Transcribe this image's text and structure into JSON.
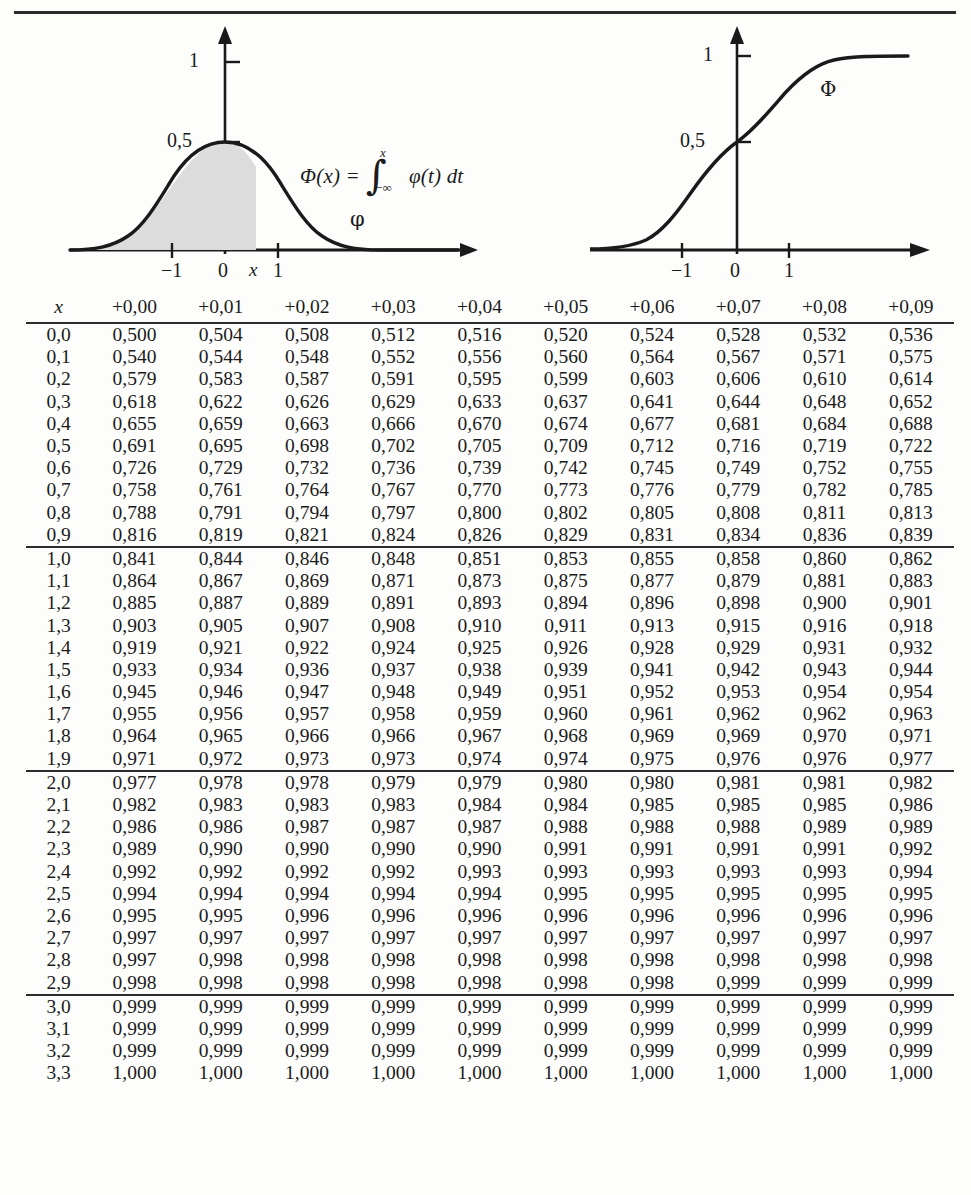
{
  "figures": {
    "density": {
      "name": "standard-normal-density",
      "curve_label": "φ",
      "y_ticks": [
        "1",
        "0,5"
      ],
      "x_ticks": [
        "−1",
        "0",
        "x",
        "1"
      ],
      "shaded_region": "area under φ from -∞ to x"
    },
    "cdf": {
      "name": "standard-normal-cdf",
      "curve_label": "Φ",
      "y_ticks": [
        "1",
        "0,5"
      ],
      "x_ticks": [
        "−1",
        "0",
        "1"
      ]
    },
    "formula": {
      "lhs": "Φ(x) =",
      "integral_upper": "x",
      "integral_lower": "−∞",
      "integrand": "φ(t) dt"
    }
  },
  "table": {
    "columns": [
      "x",
      "+0,00",
      "+0,01",
      "+0,02",
      "+0,03",
      "+0,04",
      "+0,05",
      "+0,06",
      "+0,07",
      "+0,08",
      "+0,09"
    ],
    "blocks": [
      {
        "rows": [
          [
            "0,0",
            "0,500",
            "0,504",
            "0,508",
            "0,512",
            "0,516",
            "0,520",
            "0,524",
            "0,528",
            "0,532",
            "0,536"
          ],
          [
            "0,1",
            "0,540",
            "0,544",
            "0,548",
            "0,552",
            "0,556",
            "0,560",
            "0,564",
            "0,567",
            "0,571",
            "0,575"
          ],
          [
            "0,2",
            "0,579",
            "0,583",
            "0,587",
            "0,591",
            "0,595",
            "0,599",
            "0,603",
            "0,606",
            "0,610",
            "0,614"
          ],
          [
            "0,3",
            "0,618",
            "0,622",
            "0,626",
            "0,629",
            "0,633",
            "0,637",
            "0,641",
            "0,644",
            "0,648",
            "0,652"
          ],
          [
            "0,4",
            "0,655",
            "0,659",
            "0,663",
            "0,666",
            "0,670",
            "0,674",
            "0,677",
            "0,681",
            "0,684",
            "0,688"
          ],
          [
            "0,5",
            "0,691",
            "0,695",
            "0,698",
            "0,702",
            "0,705",
            "0,709",
            "0,712",
            "0,716",
            "0,719",
            "0,722"
          ],
          [
            "0,6",
            "0,726",
            "0,729",
            "0,732",
            "0,736",
            "0,739",
            "0,742",
            "0,745",
            "0,749",
            "0,752",
            "0,755"
          ],
          [
            "0,7",
            "0,758",
            "0,761",
            "0,764",
            "0,767",
            "0,770",
            "0,773",
            "0,776",
            "0,779",
            "0,782",
            "0,785"
          ],
          [
            "0,8",
            "0,788",
            "0,791",
            "0,794",
            "0,797",
            "0,800",
            "0,802",
            "0,805",
            "0,808",
            "0,811",
            "0,813"
          ],
          [
            "0,9",
            "0,816",
            "0,819",
            "0,821",
            "0,824",
            "0,826",
            "0,829",
            "0,831",
            "0,834",
            "0,836",
            "0,839"
          ]
        ]
      },
      {
        "rows": [
          [
            "1,0",
            "0,841",
            "0,844",
            "0,846",
            "0,848",
            "0,851",
            "0,853",
            "0,855",
            "0,858",
            "0,860",
            "0,862"
          ],
          [
            "1,1",
            "0,864",
            "0,867",
            "0,869",
            "0,871",
            "0,873",
            "0,875",
            "0,877",
            "0,879",
            "0,881",
            "0,883"
          ],
          [
            "1,2",
            "0,885",
            "0,887",
            "0,889",
            "0,891",
            "0,893",
            "0,894",
            "0,896",
            "0,898",
            "0,900",
            "0,901"
          ],
          [
            "1,3",
            "0,903",
            "0,905",
            "0,907",
            "0,908",
            "0,910",
            "0,911",
            "0,913",
            "0,915",
            "0,916",
            "0,918"
          ],
          [
            "1,4",
            "0,919",
            "0,921",
            "0,922",
            "0,924",
            "0,925",
            "0,926",
            "0,928",
            "0,929",
            "0,931",
            "0,932"
          ],
          [
            "1,5",
            "0,933",
            "0,934",
            "0,936",
            "0,937",
            "0,938",
            "0,939",
            "0,941",
            "0,942",
            "0,943",
            "0,944"
          ],
          [
            "1,6",
            "0,945",
            "0,946",
            "0,947",
            "0,948",
            "0,949",
            "0,951",
            "0,952",
            "0,953",
            "0,954",
            "0,954"
          ],
          [
            "1,7",
            "0,955",
            "0,956",
            "0,957",
            "0,958",
            "0,959",
            "0,960",
            "0,961",
            "0,962",
            "0,962",
            "0,963"
          ],
          [
            "1,8",
            "0,964",
            "0,965",
            "0,966",
            "0,966",
            "0,967",
            "0,968",
            "0,969",
            "0,969",
            "0,970",
            "0,971"
          ],
          [
            "1,9",
            "0,971",
            "0,972",
            "0,973",
            "0,973",
            "0,974",
            "0,974",
            "0,975",
            "0,976",
            "0,976",
            "0,977"
          ]
        ]
      },
      {
        "rows": [
          [
            "2,0",
            "0,977",
            "0,978",
            "0,978",
            "0,979",
            "0,979",
            "0,980",
            "0,980",
            "0,981",
            "0,981",
            "0,982"
          ],
          [
            "2,1",
            "0,982",
            "0,983",
            "0,983",
            "0,983",
            "0,984",
            "0,984",
            "0,985",
            "0,985",
            "0,985",
            "0,986"
          ],
          [
            "2,2",
            "0,986",
            "0,986",
            "0,987",
            "0,987",
            "0,987",
            "0,988",
            "0,988",
            "0,988",
            "0,989",
            "0,989"
          ],
          [
            "2,3",
            "0,989",
            "0,990",
            "0,990",
            "0,990",
            "0,990",
            "0,991",
            "0,991",
            "0,991",
            "0,991",
            "0,992"
          ],
          [
            "2,4",
            "0,992",
            "0,992",
            "0,992",
            "0,992",
            "0,993",
            "0,993",
            "0,993",
            "0,993",
            "0,993",
            "0,994"
          ],
          [
            "2,5",
            "0,994",
            "0,994",
            "0,994",
            "0,994",
            "0,994",
            "0,995",
            "0,995",
            "0,995",
            "0,995",
            "0,995"
          ],
          [
            "2,6",
            "0,995",
            "0,995",
            "0,996",
            "0,996",
            "0,996",
            "0,996",
            "0,996",
            "0,996",
            "0,996",
            "0,996"
          ],
          [
            "2,7",
            "0,997",
            "0,997",
            "0,997",
            "0,997",
            "0,997",
            "0,997",
            "0,997",
            "0,997",
            "0,997",
            "0,997"
          ],
          [
            "2,8",
            "0,997",
            "0,998",
            "0,998",
            "0,998",
            "0,998",
            "0,998",
            "0,998",
            "0,998",
            "0,998",
            "0,998"
          ],
          [
            "2,9",
            "0,998",
            "0,998",
            "0,998",
            "0,998",
            "0,998",
            "0,998",
            "0,998",
            "0,999",
            "0,999",
            "0,999"
          ]
        ]
      },
      {
        "rows": [
          [
            "3,0",
            "0,999",
            "0,999",
            "0,999",
            "0,999",
            "0,999",
            "0,999",
            "0,999",
            "0,999",
            "0,999",
            "0,999"
          ],
          [
            "3,1",
            "0,999",
            "0,999",
            "0,999",
            "0,999",
            "0,999",
            "0,999",
            "0,999",
            "0,999",
            "0,999",
            "0,999"
          ],
          [
            "3,2",
            "0,999",
            "0,999",
            "0,999",
            "0,999",
            "0,999",
            "0,999",
            "0,999",
            "0,999",
            "0,999",
            "0,999"
          ],
          [
            "3,3",
            "1,000",
            "1,000",
            "1,000",
            "1,000",
            "1,000",
            "1,000",
            "1,000",
            "1,000",
            "1,000",
            "1,000"
          ]
        ]
      }
    ]
  },
  "chart_data": [
    {
      "type": "line",
      "title": "",
      "name": "standard normal density φ",
      "xlabel": "",
      "ylabel": "",
      "xlim": [
        -3.2,
        3.2
      ],
      "ylim": [
        0,
        1.05
      ],
      "xticks": [
        -1,
        0,
        1
      ],
      "xticklabels": [
        "−1",
        "0",
        "1"
      ],
      "yticks": [
        0.5,
        1
      ],
      "yticklabels": [
        "0,5",
        "1"
      ],
      "grid": false,
      "legend": "inline-label",
      "annotations": [
        "φ",
        "x",
        "Φ(x) = ∫ from −∞ to x of φ(t) dt"
      ],
      "shaded_area": {
        "from": -3.2,
        "to": 0.5,
        "fill": "#dcdcdc"
      },
      "x": [
        -3.2,
        -2.8,
        -2.4,
        -2.0,
        -1.6,
        -1.2,
        -0.8,
        -0.4,
        0.0,
        0.4,
        0.8,
        1.2,
        1.6,
        2.0,
        2.4,
        2.8,
        3.2
      ],
      "y": [
        0.002,
        0.008,
        0.022,
        0.054,
        0.111,
        0.194,
        0.29,
        0.368,
        0.399,
        0.368,
        0.29,
        0.194,
        0.111,
        0.054,
        0.022,
        0.008,
        0.002
      ]
    },
    {
      "type": "line",
      "title": "",
      "name": "standard normal cdf Φ",
      "xlabel": "",
      "ylabel": "",
      "xlim": [
        -3.2,
        3.2
      ],
      "ylim": [
        0,
        1.1
      ],
      "xticks": [
        -1,
        0,
        1
      ],
      "xticklabels": [
        "−1",
        "0",
        "1"
      ],
      "yticks": [
        0.5,
        1
      ],
      "yticklabels": [
        "0,5",
        "1"
      ],
      "grid": false,
      "legend": "inline-label",
      "annotations": [
        "Φ"
      ],
      "x": [
        -3.2,
        -2.8,
        -2.4,
        -2.0,
        -1.6,
        -1.2,
        -0.8,
        -0.4,
        0.0,
        0.4,
        0.8,
        1.2,
        1.6,
        2.0,
        2.4,
        2.8,
        3.2
      ],
      "y": [
        0.001,
        0.003,
        0.008,
        0.023,
        0.055,
        0.115,
        0.212,
        0.345,
        0.5,
        0.655,
        0.788,
        0.885,
        0.945,
        0.977,
        0.992,
        0.997,
        0.999
      ]
    },
    {
      "type": "table",
      "name": "standard-normal-cdf-table",
      "title": "",
      "columns": [
        "x",
        "+0,00",
        "+0,01",
        "+0,02",
        "+0,03",
        "+0,04",
        "+0,05",
        "+0,06",
        "+0,07",
        "+0,08",
        "+0,09"
      ],
      "row_index": [
        "0,0",
        "0,1",
        "0,2",
        "0,3",
        "0,4",
        "0,5",
        "0,6",
        "0,7",
        "0,8",
        "0,9",
        "1,0",
        "1,1",
        "1,2",
        "1,3",
        "1,4",
        "1,5",
        "1,6",
        "1,7",
        "1,8",
        "1,9",
        "2,0",
        "2,1",
        "2,2",
        "2,3",
        "2,4",
        "2,5",
        "2,6",
        "2,7",
        "2,8",
        "2,9",
        "3,0",
        "3,1",
        "3,2",
        "3,3"
      ],
      "values": [
        [
          0.5,
          0.504,
          0.508,
          0.512,
          0.516,
          0.52,
          0.524,
          0.528,
          0.532,
          0.536
        ],
        [
          0.54,
          0.544,
          0.548,
          0.552,
          0.556,
          0.56,
          0.564,
          0.567,
          0.571,
          0.575
        ],
        [
          0.579,
          0.583,
          0.587,
          0.591,
          0.595,
          0.599,
          0.603,
          0.606,
          0.61,
          0.614
        ],
        [
          0.618,
          0.622,
          0.626,
          0.629,
          0.633,
          0.637,
          0.641,
          0.644,
          0.648,
          0.652
        ],
        [
          0.655,
          0.659,
          0.663,
          0.666,
          0.67,
          0.674,
          0.677,
          0.681,
          0.684,
          0.688
        ],
        [
          0.691,
          0.695,
          0.698,
          0.702,
          0.705,
          0.709,
          0.712,
          0.716,
          0.719,
          0.722
        ],
        [
          0.726,
          0.729,
          0.732,
          0.736,
          0.739,
          0.742,
          0.745,
          0.749,
          0.752,
          0.755
        ],
        [
          0.758,
          0.761,
          0.764,
          0.767,
          0.77,
          0.773,
          0.776,
          0.779,
          0.782,
          0.785
        ],
        [
          0.788,
          0.791,
          0.794,
          0.797,
          0.8,
          0.802,
          0.805,
          0.808,
          0.811,
          0.813
        ],
        [
          0.816,
          0.819,
          0.821,
          0.824,
          0.826,
          0.829,
          0.831,
          0.834,
          0.836,
          0.839
        ],
        [
          0.841,
          0.844,
          0.846,
          0.848,
          0.851,
          0.853,
          0.855,
          0.858,
          0.86,
          0.862
        ],
        [
          0.864,
          0.867,
          0.869,
          0.871,
          0.873,
          0.875,
          0.877,
          0.879,
          0.881,
          0.883
        ],
        [
          0.885,
          0.887,
          0.889,
          0.891,
          0.893,
          0.894,
          0.896,
          0.898,
          0.9,
          0.901
        ],
        [
          0.903,
          0.905,
          0.907,
          0.908,
          0.91,
          0.911,
          0.913,
          0.915,
          0.916,
          0.918
        ],
        [
          0.919,
          0.921,
          0.922,
          0.924,
          0.925,
          0.926,
          0.928,
          0.929,
          0.931,
          0.932
        ],
        [
          0.933,
          0.934,
          0.936,
          0.937,
          0.938,
          0.939,
          0.941,
          0.942,
          0.943,
          0.944
        ],
        [
          0.945,
          0.946,
          0.947,
          0.948,
          0.949,
          0.951,
          0.952,
          0.953,
          0.954,
          0.954
        ],
        [
          0.955,
          0.956,
          0.957,
          0.958,
          0.959,
          0.96,
          0.961,
          0.962,
          0.962,
          0.963
        ],
        [
          0.964,
          0.965,
          0.966,
          0.966,
          0.967,
          0.968,
          0.969,
          0.969,
          0.97,
          0.971
        ],
        [
          0.971,
          0.972,
          0.973,
          0.973,
          0.974,
          0.974,
          0.975,
          0.976,
          0.976,
          0.977
        ],
        [
          0.977,
          0.978,
          0.978,
          0.979,
          0.979,
          0.98,
          0.98,
          0.981,
          0.981,
          0.982
        ],
        [
          0.982,
          0.983,
          0.983,
          0.983,
          0.984,
          0.984,
          0.985,
          0.985,
          0.985,
          0.986
        ],
        [
          0.986,
          0.986,
          0.987,
          0.987,
          0.987,
          0.988,
          0.988,
          0.988,
          0.989,
          0.989
        ],
        [
          0.989,
          0.99,
          0.99,
          0.99,
          0.99,
          0.991,
          0.991,
          0.991,
          0.991,
          0.992
        ],
        [
          0.992,
          0.992,
          0.992,
          0.992,
          0.993,
          0.993,
          0.993,
          0.993,
          0.993,
          0.994
        ],
        [
          0.994,
          0.994,
          0.994,
          0.994,
          0.994,
          0.995,
          0.995,
          0.995,
          0.995,
          0.995
        ],
        [
          0.995,
          0.995,
          0.996,
          0.996,
          0.996,
          0.996,
          0.996,
          0.996,
          0.996,
          0.996
        ],
        [
          0.997,
          0.997,
          0.997,
          0.997,
          0.997,
          0.997,
          0.997,
          0.997,
          0.997,
          0.997
        ],
        [
          0.997,
          0.998,
          0.998,
          0.998,
          0.998,
          0.998,
          0.998,
          0.998,
          0.998,
          0.998
        ],
        [
          0.998,
          0.998,
          0.998,
          0.998,
          0.998,
          0.998,
          0.998,
          0.999,
          0.999,
          0.999
        ],
        [
          0.999,
          0.999,
          0.999,
          0.999,
          0.999,
          0.999,
          0.999,
          0.999,
          0.999,
          0.999
        ],
        [
          0.999,
          0.999,
          0.999,
          0.999,
          0.999,
          0.999,
          0.999,
          0.999,
          0.999,
          0.999
        ],
        [
          0.999,
          0.999,
          0.999,
          0.999,
          0.999,
          0.999,
          0.999,
          0.999,
          0.999,
          0.999
        ],
        [
          1.0,
          1.0,
          1.0,
          1.0,
          1.0,
          1.0,
          1.0,
          1.0,
          1.0,
          1.0
        ]
      ]
    }
  ],
  "colors": {
    "ink": "#1a1a1a",
    "rule": "#2b2b2b",
    "shade": "#dcdcdc",
    "paper": "#fdfdfc"
  }
}
